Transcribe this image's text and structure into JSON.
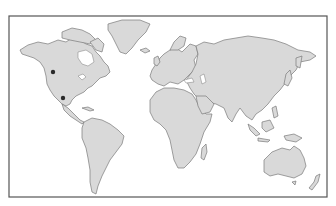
{
  "map": {
    "type": "world-outline",
    "projection": "miller-like",
    "colors": {
      "land": "#d9d9d9",
      "coastline": "#7a7a7a",
      "ocean": "#ffffff",
      "frame": "#555555",
      "marker": "#2a2a2a"
    },
    "frame": {
      "x": 9,
      "y": 16,
      "width": 318,
      "height": 181
    },
    "markers": [
      {
        "id": "marker-1",
        "region": "western North America",
        "x": 53,
        "y": 72
      },
      {
        "id": "marker-2",
        "region": "northern Mexico",
        "x": 63,
        "y": 98
      }
    ],
    "continents": [
      "North America",
      "Greenland",
      "South America",
      "Europe",
      "Africa",
      "Asia",
      "Australia",
      "New Zealand"
    ]
  }
}
